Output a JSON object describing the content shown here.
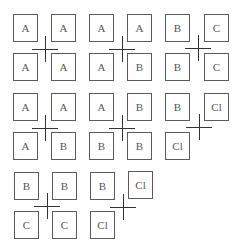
{
  "diagram": {
    "groups": [
      {
        "labels": [
          "A",
          "A",
          "A",
          "A"
        ]
      },
      {
        "labels": [
          "A",
          "A",
          "A",
          "B"
        ]
      },
      {
        "labels": [
          "B",
          "C",
          "B",
          "C"
        ]
      },
      {
        "labels": [
          "A",
          "A",
          "A",
          "B"
        ]
      },
      {
        "labels": [
          "A",
          "B",
          "B",
          "B"
        ]
      },
      {
        "labels": [
          "B",
          "Cl",
          "Cl"
        ]
      },
      {
        "labels": [
          "B",
          "B",
          "C",
          "C"
        ]
      },
      {
        "labels": [
          "B",
          "Cl",
          "Cl"
        ]
      }
    ]
  },
  "colors": {
    "box_border": "#5a5a5a",
    "cross": "#333333",
    "text": "#555555",
    "background": "#ffffff"
  }
}
